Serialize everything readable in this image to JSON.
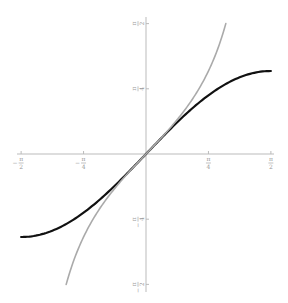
{
  "chart_data": {
    "type": "line",
    "title": "",
    "xlabel": "",
    "ylabel": "",
    "xlim": [
      -1.5708,
      1.5708
    ],
    "ylim": [
      -1.5708,
      1.5708
    ],
    "grid": false,
    "legend": null,
    "axes_through_origin": true,
    "x_ticks": [
      {
        "value": -1.5708,
        "label": "-π/2"
      },
      {
        "value": -0.7854,
        "label": "-π/4"
      },
      {
        "value": 0.7854,
        "label": "π/4"
      },
      {
        "value": 1.5708,
        "label": "π/2"
      }
    ],
    "y_ticks": [
      {
        "value": 1.5708,
        "label": "π/2"
      },
      {
        "value": 0.7854,
        "label": "π/4"
      },
      {
        "value": -0.7854,
        "label": "-π/4"
      },
      {
        "value": -1.5708,
        "label": "-π/2"
      }
    ],
    "series": [
      {
        "name": "sin(x)",
        "color": "#111111",
        "x": [
          -1.5708,
          -1.1781,
          -0.7854,
          -0.3927,
          0,
          0.3927,
          0.7854,
          1.1781,
          1.5708
        ],
        "y": [
          -1.0,
          -0.9239,
          -0.7071,
          -0.3827,
          0,
          0.3827,
          0.7071,
          0.9239,
          1.0
        ]
      },
      {
        "name": "tan(x)",
        "color": "#aaaaaa",
        "x": [
          -1.0039,
          -0.7854,
          -0.3927,
          0,
          0.3927,
          0.7854,
          1.0039
        ],
        "y": [
          -1.5708,
          -1.0,
          -0.4142,
          0,
          0.4142,
          1.0,
          1.5708
        ]
      }
    ]
  },
  "layout": {
    "origin_px": [
      146,
      154
    ],
    "x_scale_px_per_unit": 79.5,
    "y_scale_px_per_unit": 83,
    "axis_color": "#bbbbbb",
    "x_axis_px": [
      17,
      274
    ],
    "y_axis_px": [
      17,
      292
    ]
  }
}
